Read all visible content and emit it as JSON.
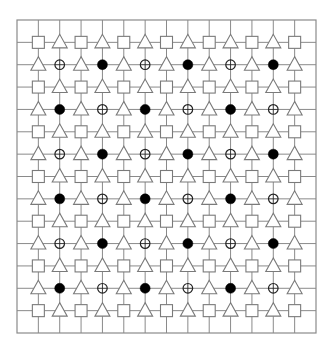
{
  "diagram": {
    "title": "",
    "grid": {
      "left": 17,
      "top": 20,
      "right": 316,
      "bottom": 333,
      "divisions_x": 14,
      "divisions_y": 14,
      "line_color": "#8a8a8a"
    },
    "shape_colors": {
      "outline": "#7a7a7a",
      "circle_outline": "#222222",
      "filled": "#000000",
      "shape_fill": "#ffffff"
    },
    "legend": [
      {
        "symbol": "S",
        "shape": "square"
      },
      {
        "symbol": "T",
        "shape": "triangle"
      },
      {
        "symbol": "o",
        "shape": "open-circle-crossed"
      },
      {
        "symbol": "x",
        "shape": "filled-circle"
      }
    ],
    "rows": [
      "STSTSTSTSTSTS",
      "ToTxToTxToTxT",
      "STSTSTSTSTSTS",
      "TxToTxToTxToT",
      "STSTSTSTSTSTS",
      "ToTxToTxToTxT",
      "STSTSTSTSTSTS",
      "TxToTxToTxToT",
      "STSTSTSTSTSTS",
      "ToTxToTxToTxT",
      "STSTSTSTSTSTS",
      "TxToTxToTxToT",
      "STSTSTSTSTSTS"
    ]
  }
}
